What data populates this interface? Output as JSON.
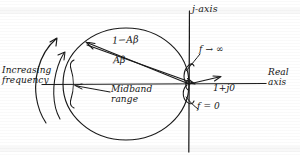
{
  "figure": {
    "type": "hand-drawn-nyquist-diagram",
    "ink_color": "#141414",
    "background_color": "#ffffff"
  },
  "axes": {
    "vertical_label": "j-axis",
    "horizontal_label_line1": "Real",
    "horizontal_label_line2": "axis"
  },
  "vectors": {
    "resultant_label": "1−Aβ",
    "loop_gain_label": "Aβ",
    "unity_point_label": "1+j0"
  },
  "annotations": {
    "increasing_frequency_line1": "Increasing",
    "increasing_frequency_line2": "frequency",
    "midband_line1": "Midband",
    "midband_line2": "range",
    "high_frequency_limit": "f → ∞",
    "zero_frequency": "f = 0"
  },
  "geometry": {
    "circle_center_x": 126,
    "circle_center_y": 84,
    "circle_radius_x": 63,
    "circle_radius_y": 56,
    "origin_x": 189,
    "origin_y": 84,
    "locus_point_x": 86,
    "locus_point_y": 42
  }
}
